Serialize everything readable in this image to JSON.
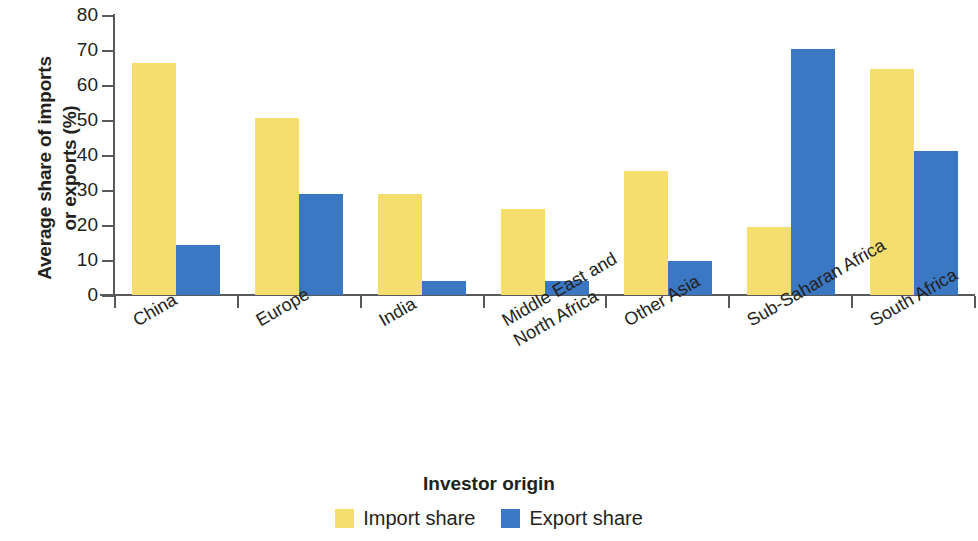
{
  "chart_data": {
    "type": "bar",
    "title": "",
    "xlabel": "Investor origin",
    "ylabel": "Average share of imports\nor exports (%)",
    "categories": [
      "China",
      "Europe",
      "India",
      "Middle East and\nNorth Africa",
      "Other Asia",
      "Sub-Saharan Africa",
      "South Africa"
    ],
    "series": [
      {
        "name": "Import share",
        "color": "#f5de6e",
        "values": [
          66.3,
          50.7,
          29.0,
          24.6,
          35.4,
          19.4,
          64.6
        ]
      },
      {
        "name": "Export share",
        "color": "#3b78c3",
        "values": [
          14.4,
          28.9,
          4.0,
          4.1,
          9.7,
          70.2,
          41.2
        ]
      }
    ],
    "ylim": [
      0,
      80
    ],
    "yticks": [
      0,
      10,
      20,
      30,
      40,
      50,
      60,
      70,
      80
    ],
    "ytick_labels": [
      "0",
      "10",
      "20",
      "30",
      "40",
      "50",
      "60",
      "70",
      "80"
    ],
    "grid": false,
    "legend_position": "bottom",
    "xtick_label_rotation": -30
  },
  "axis": {
    "y_title": "Average share of imports\nor exports (%)",
    "x_title": "Investor origin"
  },
  "legend": {
    "items": [
      {
        "label": "Import share",
        "color": "#f5de6e"
      },
      {
        "label": "Export share",
        "color": "#3b78c3"
      }
    ]
  },
  "colors": {
    "import_share": "#f5de6e",
    "export_share": "#3b78c3",
    "axis": "#58595b",
    "text": "#231f20",
    "background": "#ffffff"
  }
}
